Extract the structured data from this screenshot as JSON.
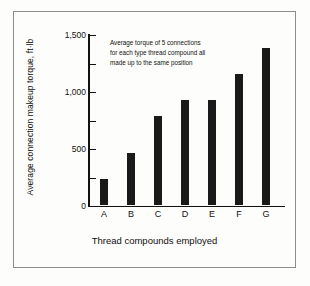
{
  "chart_data": {
    "type": "bar",
    "title": "",
    "xlabel": "Thread compounds employed",
    "ylabel": "Average connection makeup torque, ft·lb",
    "categories": [
      "A",
      "B",
      "C",
      "D",
      "E",
      "F",
      "G"
    ],
    "values": [
      230,
      460,
      790,
      925,
      925,
      1160,
      1390
    ],
    "ylim": [
      0,
      1500
    ],
    "ytick_labels": [
      "0",
      "500",
      "1,000",
      "1,500"
    ],
    "ytick_values": [
      0,
      500,
      1000,
      1500
    ],
    "minor_tick_values": [
      250,
      750,
      1250
    ],
    "grid": false,
    "legend": "none",
    "annotation": "Average torque of 5 connections\nfor each type thread compound all\nmade up to the same position",
    "bar_color": "#1a1a1a",
    "axis_color": "#111111",
    "frame_color": "#8d8d8d",
    "background": "#fdfdfb"
  }
}
